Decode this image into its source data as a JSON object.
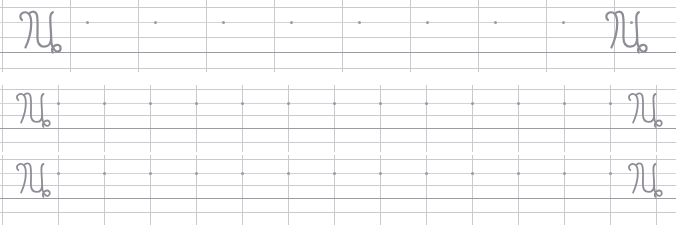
{
  "worksheet": {
    "title": "Cursive Capital U Handwriting Practice Worksheet",
    "letter": "U",
    "letter_case": "uppercase",
    "script_style": "cursive",
    "stroke_color": "#8d8d96",
    "rule_color": "#c9c9cf",
    "baseline_color": "#9b9ba4",
    "dot_color": "#9a9aa3",
    "paper_color": "#ffffff",
    "page_width": 676,
    "page_height": 228,
    "row_count": 3,
    "rows": [
      {
        "index": 1,
        "name": "practice-row-large",
        "top": 0,
        "height": 72,
        "line_count": 5,
        "lines": [
          {
            "name": "ascender-line",
            "y": 7,
            "weight": "light"
          },
          {
            "name": "midline",
            "y": 22,
            "weight": "dotted-guide"
          },
          {
            "name": "x-height-line",
            "y": 37,
            "weight": "light"
          },
          {
            "name": "baseline",
            "y": 52,
            "weight": "heavy"
          },
          {
            "name": "descender-line",
            "y": 68,
            "weight": "light"
          }
        ],
        "column_spacing": 68,
        "column_count": 10,
        "dot_count": 10,
        "dot_y": 22,
        "dot_first_x": 86,
        "dot_spacing": 68,
        "glyph_left": {
          "x": 14,
          "y": 8,
          "width": 52,
          "height": 48
        },
        "glyph_right": {
          "x": 600,
          "y": 8,
          "width": 52,
          "height": 48
        }
      },
      {
        "index": 2,
        "name": "practice-row-medium-a",
        "top": 85,
        "height": 67,
        "line_count": 5,
        "lines": [
          {
            "name": "ascender-line",
            "y": 4,
            "weight": "light"
          },
          {
            "name": "midline",
            "y": 18,
            "weight": "dotted-guide"
          },
          {
            "name": "x-height-line",
            "y": 30,
            "weight": "light"
          },
          {
            "name": "baseline",
            "y": 43,
            "weight": "heavy"
          },
          {
            "name": "descender-line",
            "y": 57,
            "weight": "light"
          }
        ],
        "column_spacing": 46,
        "column_count": 14,
        "dot_count": 13,
        "dot_y": 18,
        "dot_first_x": 57,
        "dot_spacing": 46,
        "glyph_left": {
          "x": 12,
          "y": 4,
          "width": 42,
          "height": 42
        },
        "glyph_right": {
          "x": 624,
          "y": 4,
          "width": 42,
          "height": 42
        }
      },
      {
        "index": 3,
        "name": "practice-row-medium-b",
        "top": 155,
        "height": 70,
        "line_count": 5,
        "lines": [
          {
            "name": "ascender-line",
            "y": 4,
            "weight": "light"
          },
          {
            "name": "midline",
            "y": 18,
            "weight": "dotted-guide"
          },
          {
            "name": "x-height-line",
            "y": 30,
            "weight": "light"
          },
          {
            "name": "baseline",
            "y": 43,
            "weight": "heavy"
          },
          {
            "name": "descender-line",
            "y": 57,
            "weight": "light"
          }
        ],
        "column_spacing": 46,
        "column_count": 14,
        "dot_count": 13,
        "dot_y": 18,
        "dot_first_x": 57,
        "dot_spacing": 46,
        "glyph_left": {
          "x": 12,
          "y": 4,
          "width": 42,
          "height": 42
        },
        "glyph_right": {
          "x": 624,
          "y": 4,
          "width": 42,
          "height": 42
        }
      }
    ],
    "glyph_path": "M 9,14 C 3,8 12,2 17,7 C 21,11 20,24 18,32 C 16,40 14,44 13,46 M 17,7 C 19,4 24,3 26,7 C 28,12 27,26 27,34 C 27,41 30,45 35,45 C 40,45 43,41 43,35 C 43,28 42,20 42,12 C 42,8 43,6 45,5 M 43,35 C 43,40 44,46 47,49 C 50,52 54,51 54,47 C 54,43 50,42 47,44 C 44,46 43,50 45,52"
  }
}
